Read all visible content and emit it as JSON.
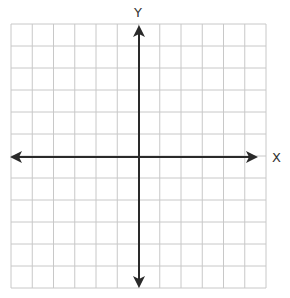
{
  "diagram": {
    "type": "coordinate-plane",
    "x_axis_label": "X",
    "y_axis_label": "Y",
    "grid": {
      "columns": 12,
      "rows": 12,
      "left": 11,
      "top": 24,
      "right": 266,
      "bottom": 288,
      "line_color": "#c8c8c8"
    },
    "axes": {
      "origin_x": 139,
      "origin_y": 157,
      "color": "#2a2a2a",
      "arrows": "both-ends"
    }
  }
}
